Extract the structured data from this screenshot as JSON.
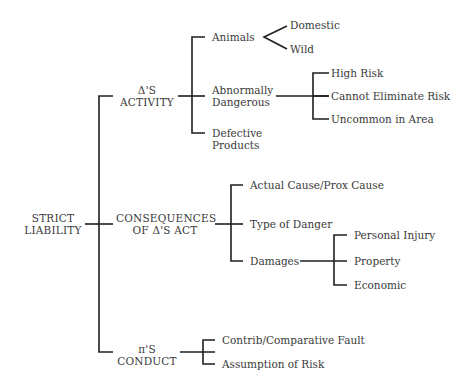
{
  "root": {
    "line1": "STRICT",
    "line2": "LIABILITY"
  },
  "branches": [
    {
      "line1": "Δ'S",
      "line2": "ACTIVITY",
      "children": [
        {
          "label": "Animals",
          "children": [
            "Domestic",
            "Wild"
          ]
        },
        {
          "line1": "Abnormally",
          "line2": "Dangerous",
          "children": [
            "High Risk",
            "Cannot Eliminate Risk",
            "Uncommon in Area"
          ]
        },
        {
          "line1": "Defective",
          "line2": "Products"
        }
      ]
    },
    {
      "line1": "CONSEQUENCES",
      "line2": "OF Δ'S ACT",
      "children": [
        {
          "label": "Actual Cause/Prox Cause"
        },
        {
          "label": "Type of Danger"
        },
        {
          "label": "Damages",
          "children": [
            "Personal Injury",
            "Property",
            "Economic"
          ]
        }
      ]
    },
    {
      "line1": "π'S",
      "line2": "CONDUCT",
      "children": [
        {
          "label": "Contrib/Comparative Fault"
        },
        {
          "label": "Assumption of Risk"
        }
      ]
    }
  ],
  "colors": {
    "line": "#1e1e1e",
    "text": "#3a3a3a",
    "background": "#ffffff"
  }
}
